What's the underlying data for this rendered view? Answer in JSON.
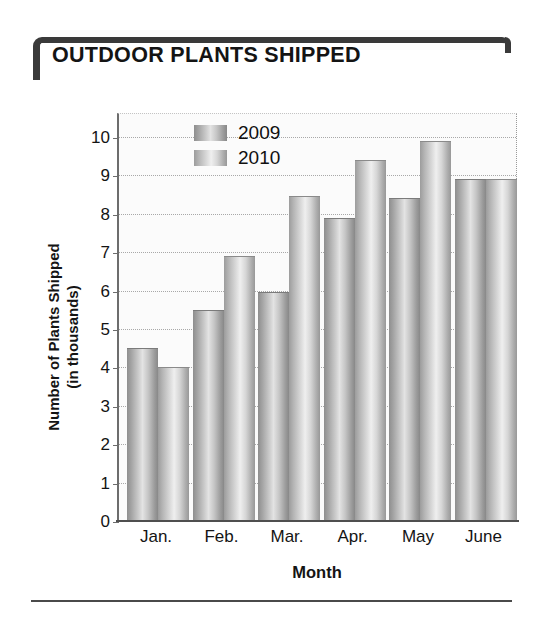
{
  "chart_title": "OUTDOOR PLANTS SHIPPED",
  "legend": {
    "position": "top-left-inside",
    "entries": [
      {
        "label": "2009",
        "color": "#b9b9b9"
      },
      {
        "label": "2010",
        "color": "#cfcfcf"
      }
    ]
  },
  "axes": {
    "y_title_line1": "Number of Plants Shipped",
    "y_title_line2": "(in thousands)",
    "x_title": "Month",
    "y_ticks": [
      "10",
      "9",
      "8",
      "7",
      "6",
      "5",
      "4",
      "3",
      "2",
      "1",
      "0"
    ],
    "x_ticks": [
      "Jan.",
      "Feb.",
      "Mar.",
      "Apr.",
      "May",
      "June"
    ]
  },
  "chart_data": {
    "type": "bar",
    "title": "OUTDOOR PLANTS SHIPPED",
    "xlabel": "Month",
    "ylabel": "Number of Plants Shipped (in thousands)",
    "ylim": [
      0,
      10
    ],
    "ytick_step": 1,
    "grid": true,
    "legend_position": "upper left (inside plot)",
    "categories": [
      "Jan.",
      "Feb.",
      "Mar.",
      "Apr.",
      "May",
      "June"
    ],
    "series": [
      {
        "name": "2009",
        "color": "#b9b9b9",
        "values": [
          4.45,
          5.45,
          5.9,
          7.85,
          8.35,
          8.85
        ]
      },
      {
        "name": "2010",
        "color": "#cfcfcf",
        "values": [
          3.95,
          6.85,
          8.4,
          9.35,
          9.85,
          8.85
        ]
      }
    ]
  }
}
